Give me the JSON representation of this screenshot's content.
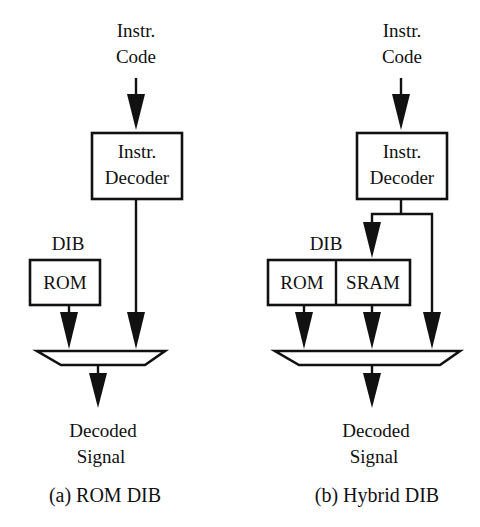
{
  "figure": {
    "panels": [
      {
        "id": "a",
        "caption": "(a) ROM DIB",
        "input": {
          "line1": "Instr.",
          "line2": "Code"
        },
        "decoder": {
          "line1": "Instr.",
          "line2": "Decoder"
        },
        "dib_label": "DIB",
        "dib_blocks": [
          "ROM"
        ],
        "output": {
          "line1": "Decoded",
          "line2": "Signal"
        }
      },
      {
        "id": "b",
        "caption": "(b) Hybrid DIB",
        "input": {
          "line1": "Instr.",
          "line2": "Code"
        },
        "decoder": {
          "line1": "Instr.",
          "line2": "Decoder"
        },
        "dib_label": "DIB",
        "dib_blocks": [
          "ROM",
          "SRAM"
        ],
        "output": {
          "line1": "Decoded",
          "line2": "Signal"
        }
      }
    ],
    "colors": {
      "ink": "#111111",
      "background": "#ffffff"
    }
  }
}
